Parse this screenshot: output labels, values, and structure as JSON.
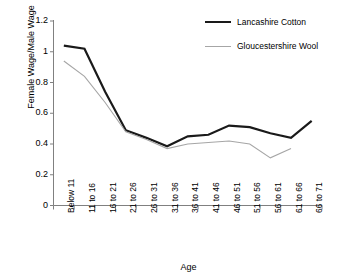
{
  "chart_data": {
    "type": "line",
    "title": "",
    "xlabel": "Age",
    "ylabel": "Female Wage/Male Wage",
    "categories": [
      "Below 11",
      "11 to 16",
      "16 to 21",
      "21 to 26",
      "26 to 31",
      "31 to 36",
      "36 to 41",
      "41 to 46",
      "46 to 51",
      "51 to 56",
      "56 to 61",
      "61 to 66",
      "66 to 71"
    ],
    "ylim": [
      0,
      1.2
    ],
    "yticks": [
      0,
      0.2,
      0.4,
      0.6,
      0.8,
      1,
      1.2
    ],
    "ytick_labels": [
      "0",
      "0.2",
      "0.4",
      "0.6",
      "0.8",
      "1",
      "1.2"
    ],
    "grid": false,
    "legend_position": "top-right",
    "series": [
      {
        "name": "Lancashire Cotton",
        "color": "#1a1a1a",
        "line_width": 2.2,
        "values": [
          1.04,
          1.02,
          0.74,
          0.49,
          0.44,
          0.385,
          0.45,
          0.46,
          0.52,
          0.51,
          0.47,
          0.44,
          0.55
        ]
      },
      {
        "name": "Gloucestershire Wool",
        "color": "#a6a6a6",
        "line_width": 1.1,
        "values": [
          0.94,
          0.84,
          0.67,
          0.48,
          0.43,
          0.37,
          0.4,
          0.41,
          0.42,
          0.4,
          0.31,
          0.37,
          null
        ]
      }
    ]
  },
  "legend": {
    "items": [
      {
        "label": "Lancashire Cotton"
      },
      {
        "label": "Gloucestershire Wool"
      }
    ]
  },
  "axes": {
    "y_title": "Female Wage/Male Wage",
    "x_title": "Age"
  },
  "colors": {
    "series_0": "#1a1a1a",
    "series_1": "#a6a6a6",
    "axis": "#808080",
    "background": "#ffffff"
  }
}
